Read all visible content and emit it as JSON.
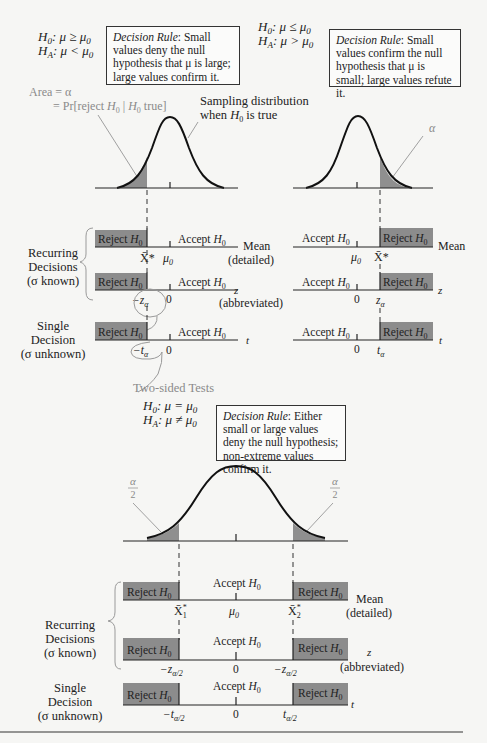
{
  "one_sided_left": {
    "h0": "H0: μ ≥ μ0",
    "ha": "HA: μ < μ0",
    "decision_rule_label": "Decision Rule",
    "decision_rule_text": ": Small values deny the null hypothesis that μ is large; large values confirm it.",
    "area_label_1": "Area = α",
    "area_label_2": "= Pr[reject H0 | H0 true]",
    "curve_label_1": "Sampling distribution",
    "curve_label_2": "when H0 is true",
    "rows": {
      "mean": {
        "reject": "Reject H0",
        "accept": "Accept H0",
        "cutoff": "X̄*",
        "center": "μ0",
        "axis": "Mean",
        "axis_note": "(detailed)"
      },
      "z": {
        "reject": "Reject H0",
        "accept": "Accept H0",
        "cutoff": "−zα",
        "center": "0",
        "axis": "z",
        "axis_note": "(abbreviated)"
      },
      "t": {
        "reject": "Reject H0",
        "accept": "Accept H0",
        "cutoff": "−tα",
        "center": "0",
        "axis": "t"
      }
    }
  },
  "one_sided_right": {
    "h0": "H0: μ ≤ μ0",
    "ha": "HA: μ > μ0",
    "decision_rule_label": "Decision Rule",
    "decision_rule_text": ": Small values confirm the null hypothesis that μ is small; large values refute it.",
    "alpha_label": "α",
    "rows": {
      "mean": {
        "reject": "Reject H0",
        "accept": "Accept H0",
        "cutoff": "X̄*",
        "center": "μ0",
        "axis": "Mean"
      },
      "z": {
        "reject": "Reject H0",
        "accept": "Accept H0",
        "cutoff": "zα",
        "center": "0",
        "axis": "z"
      },
      "t": {
        "reject": "Reject H0",
        "accept": "Accept H0",
        "cutoff": "tα",
        "center": "0",
        "axis": "t"
      }
    }
  },
  "row_labels": {
    "recurring": [
      "Recurring",
      "Decisions",
      "(σ known)"
    ],
    "single": [
      "Single",
      "Decision",
      "(σ unknown)"
    ]
  },
  "two_sided": {
    "heading": "Two-sided Tests",
    "h0": "H0: μ = μ0",
    "ha": "HA: μ ≠ μ0",
    "decision_rule_label": "Decision Rule",
    "decision_rule_text": ": Either small or large values deny the null hypothesis; non-extreme values confirm it.",
    "alpha_half_num": "α",
    "alpha_half_den": "2",
    "rows": {
      "mean": {
        "reject": "Reject H0",
        "accept": "Accept H0",
        "cutoff_low": "X̄1*",
        "cutoff_high": "X̄2*",
        "center": "μ0",
        "axis": "Mean",
        "axis_note": "(detailed)"
      },
      "z": {
        "reject": "Reject H0",
        "accept": "Accept H0",
        "cutoff_low": "−zα/2",
        "cutoff_high": "−zα/2",
        "center": "0",
        "axis": "z",
        "axis_note": "(abbreviated)"
      },
      "t": {
        "reject": "Reject H0",
        "accept": "Accept H0",
        "cutoff_low": "−tα/2",
        "cutoff_high": "tα/2",
        "center": "0",
        "axis": "t"
      }
    }
  },
  "colors": {
    "shade": "#8f8f8f",
    "reject_box": "#8c8c8c",
    "ink": "#222222",
    "annotation": "#9a9a9a"
  }
}
